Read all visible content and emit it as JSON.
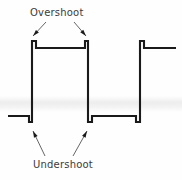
{
  "figure": {
    "background_color": "#fefefe",
    "trace_color": "#1a1a1a",
    "label_color": "#3b3b3b"
  },
  "labels": {
    "overshoot": "Overshoot",
    "undershoot": "Undershoot"
  },
  "chart_data": {
    "type": "line",
    "title": "",
    "xlabel": "",
    "ylabel": "",
    "grid": false,
    "legend": null,
    "xlim": [
      0,
      182
    ],
    "ylim": [
      180,
      0
    ],
    "annotations": [
      {
        "text": "Overshoot",
        "text_x": 30,
        "text_y": 8,
        "leader_lines": [
          {
            "x1": 46,
            "y1": 22,
            "x2": 33,
            "y2": 36
          },
          {
            "x1": 74,
            "y1": 22,
            "x2": 86,
            "y2": 36
          }
        ],
        "arrow_direction": "down"
      },
      {
        "text": "Undershoot",
        "text_x": 33,
        "text_y": 160,
        "leader_lines": [
          {
            "x1": 45,
            "y1": 156,
            "x2": 33,
            "y2": 131
          },
          {
            "x1": 73,
            "y1": 156,
            "x2": 87,
            "y2": 131
          }
        ],
        "arrow_direction": "up"
      }
    ],
    "series": [
      {
        "name": "pulse-waveform",
        "points": [
          [
            8,
            116
          ],
          [
            29,
            116
          ],
          [
            29,
            122
          ],
          [
            32,
            122
          ],
          [
            32,
            41
          ],
          [
            36,
            41
          ],
          [
            36,
            48
          ],
          [
            85,
            48
          ],
          [
            85,
            41
          ],
          [
            88,
            41
          ],
          [
            88,
            122
          ],
          [
            92,
            122
          ],
          [
            92,
            116
          ],
          [
            136,
            116
          ],
          [
            136,
            122
          ],
          [
            140,
            122
          ],
          [
            140,
            41
          ],
          [
            144,
            41
          ],
          [
            144,
            48
          ],
          [
            176,
            48
          ]
        ]
      }
    ],
    "levels": {
      "baseline_y": 116,
      "settled_high_y": 48,
      "overshoot_peak_y": 41,
      "undershoot_trough_y": 122
    },
    "edges": [
      {
        "type": "rising",
        "x": 32,
        "has_overshoot": true,
        "has_undershoot": true
      },
      {
        "type": "falling",
        "x": 88,
        "has_overshoot": true,
        "has_undershoot": true
      },
      {
        "type": "rising",
        "x": 140,
        "has_overshoot": true,
        "has_undershoot": true
      }
    ]
  }
}
